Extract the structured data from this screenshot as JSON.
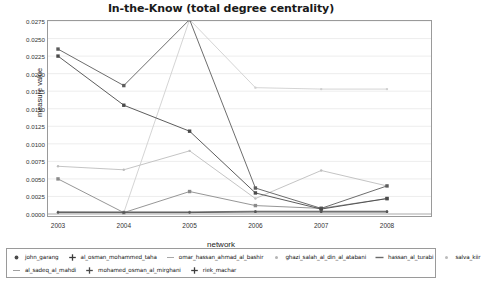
{
  "chart_data": {
    "type": "line",
    "title": "In-the-Know (total degree centrality)",
    "xlabel": "network",
    "ylabel": "measure value",
    "categories": [
      "2003",
      "2004",
      "2005",
      "2006",
      "2007",
      "2008"
    ],
    "x": [
      2003,
      2004,
      2005,
      2006,
      2007,
      2008
    ],
    "ylim": [
      0.0,
      0.0275
    ],
    "xlim": [
      2003,
      2008
    ],
    "yticks": [
      "0.0000",
      "0.0025",
      "0.0050",
      "0.0075",
      "0.0100",
      "0.0125",
      "0.0150",
      "0.0175",
      "0.0200",
      "0.0225",
      "0.0250",
      "0.0275"
    ],
    "ytick_values": [
      0.0,
      0.0025,
      0.005,
      0.0075,
      0.01,
      0.0125,
      0.015,
      0.0175,
      0.02,
      0.0225,
      0.025,
      0.0275
    ],
    "grid": true,
    "grid_axis": "y",
    "legend_position": "bottom",
    "series": [
      {
        "name": "john_garang",
        "color": "#4a4a4a",
        "marker": "square",
        "values": [
          0.0225,
          0.0155,
          0.0118,
          0.003,
          0.0007,
          0.0022
        ]
      },
      {
        "name": "al_osman_mohammed_taha",
        "color": "#5c5c5c",
        "marker": "square",
        "values": [
          0.0235,
          0.0183,
          0.0277,
          0.0037,
          0.0008,
          0.004
        ]
      },
      {
        "name": "omar_hassan_ahmad_al_bashir",
        "color": "#cfcfcf",
        "marker": "dot",
        "values": [
          0.0003,
          0.0002,
          0.0277,
          0.018,
          0.0178,
          0.0178
        ]
      },
      {
        "name": "ghazi_salah_al_din_al_atabani",
        "color": "#bdbdbd",
        "marker": "dot",
        "values": [
          0.0068,
          0.0063,
          0.009,
          0.0022,
          0.0062,
          0.004
        ]
      },
      {
        "name": "hassan_al_turabi",
        "color": "#8a8a8a",
        "marker": "square",
        "values": [
          0.005,
          0.0002,
          0.0032,
          0.0012,
          0.0008,
          0.0022
        ]
      },
      {
        "name": "salva_kiir",
        "color": "#d6d6d6",
        "marker": "dot",
        "values": [
          0.0002,
          0.0002,
          0.0002,
          0.0002,
          0.0002,
          0.0002
        ]
      },
      {
        "name": "al_sadeq_al_mahdi",
        "color": "#c4c4c4",
        "marker": "dot",
        "values": [
          0.0002,
          0.0002,
          0.0002,
          0.0003,
          0.0003,
          0.0003
        ]
      },
      {
        "name": "mohamed_osman_al_mirghani",
        "color": "#6e6e6e",
        "marker": "dot",
        "values": [
          0.0003,
          0.0003,
          0.0003,
          0.0004,
          0.0004,
          0.0004
        ]
      },
      {
        "name": "riek_machar",
        "color": "#555555",
        "marker": "dot",
        "values": [
          0.0002,
          0.0002,
          0.0002,
          0.0003,
          0.0003,
          0.0003
        ]
      }
    ]
  },
  "legend": {
    "rows": [
      [
        {
          "label": "john_garang",
          "marker": "dot",
          "color": "#4a4a4a"
        },
        {
          "label": "al_osman_mohammed_taha",
          "marker": "plus",
          "color": "#3c3c3c"
        },
        {
          "label": "omar_hassan_ahmad_al_bashir",
          "marker": "dash",
          "color": "#a8a8a8"
        },
        {
          "label": "ghazi_salah_al_din_al_atabani",
          "marker": "dot-light",
          "color": "#b5b5b5"
        },
        {
          "label": "hassan_al_turabi",
          "marker": "line",
          "color": "#6a6a6a"
        },
        {
          "label": "salva_kiir",
          "marker": "dot-light",
          "color": "#bbbbbb"
        }
      ],
      [
        {
          "label": "al_sadeq_al_mahdi",
          "marker": "dash",
          "color": "#a0a0a0"
        },
        {
          "label": "mohamed_osman_al_mirghani",
          "marker": "plus",
          "color": "#4a4a4a"
        },
        {
          "label": "riek_machar",
          "marker": "plus",
          "color": "#3c3c3c"
        }
      ]
    ]
  }
}
